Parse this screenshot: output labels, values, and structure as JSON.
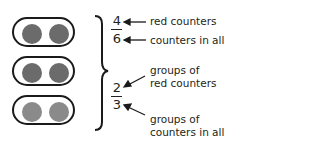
{
  "groups": [
    {
      "counters": [
        "red",
        "red"
      ]
    },
    {
      "counters": [
        "red",
        "red"
      ]
    },
    {
      "counters": [
        "other",
        "other"
      ]
    }
  ],
  "colors": {
    "red_counter": "#6b6b6b",
    "other_counter": "#8a8a8a",
    "outline": "#1a1a1a"
  },
  "fraction_counters": {
    "numerator": "4",
    "denominator": "6",
    "numerator_label": "red counters",
    "denominator_label": "counters in all"
  },
  "fraction_groups": {
    "numerator": "2",
    "denominator": "3",
    "numerator_label_line1": "groups of",
    "numerator_label_line2": "red counters",
    "denominator_label_line1": "groups of",
    "denominator_label_line2": "counters in all"
  }
}
